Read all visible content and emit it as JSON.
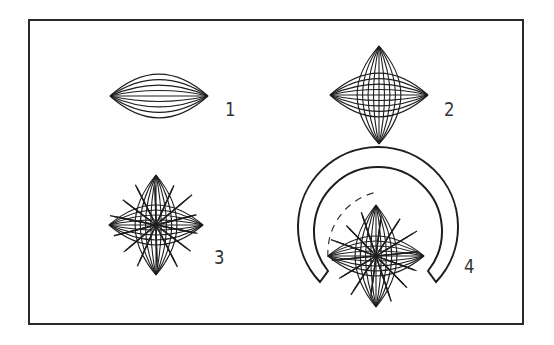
{
  "figure": {
    "type": "diagram",
    "panels": [
      {
        "id": 1,
        "label": "1",
        "content": "single spindle of horizontal fibres",
        "label_pos": [
          226,
          97
        ]
      },
      {
        "id": 2,
        "label": "2",
        "content": "two crossed spindles (horizontal and vertical)",
        "label_pos": [
          446,
          97
        ]
      },
      {
        "id": 3,
        "label": "3",
        "content": "crossed spindles with radiating rays",
        "label_pos": [
          215,
          244
        ]
      },
      {
        "id": 4,
        "label": "4",
        "content": "crossed spindles with rays enclosed by horseshoe-shaped arc and dashed inner arc",
        "label_pos": [
          466,
          254
        ]
      }
    ]
  },
  "style": {
    "stroke_color": "#1e1e1e",
    "frame_color": "#2a2a2a",
    "label_color": "#333333",
    "background": "#ffffff"
  }
}
